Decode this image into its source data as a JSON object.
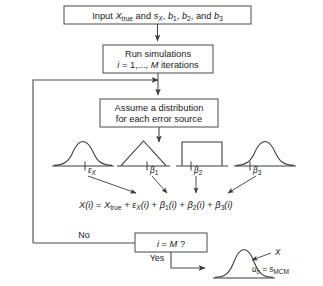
{
  "diagram": {
    "boxes": {
      "input": {
        "line1_pre": "Input ",
        "var_x": "X",
        "var_x_sub": "true",
        "mid1": " and ",
        "var_s": "s",
        "var_s_sub": "X",
        "mid2": ", ",
        "b1": "b",
        "b1_sub": "1",
        "mid3": ", ",
        "b2": "b",
        "b2_sub": "2",
        "mid4": ", and ",
        "b3": "b",
        "b3_sub": "3",
        "full_text": "Input Xtrue and sX, b1, b2, and b3"
      },
      "run": {
        "line1": "Run simulations",
        "line2_i": "i",
        "line2_rest": " = 1,..., ",
        "line2_m": "M",
        "line2_tail": " iterations",
        "full_text": "Run simulations i = 1,..., M iterations"
      },
      "assume": {
        "line1": "Assume a distribution",
        "line2": "for each error source",
        "full_text": "Assume a distribution for each error source"
      },
      "decision": {
        "i": "i",
        "eq": " = ",
        "m": "M",
        "q": " ?",
        "full_text": "i = M ?"
      }
    },
    "branches": {
      "no_label": "No",
      "yes_label": "Yes"
    },
    "distributions": [
      {
        "name": "normal-epsilon-x",
        "shape": "normal",
        "label_main": "ε",
        "label_sub": "X"
      },
      {
        "name": "triangular-beta1",
        "shape": "triangular",
        "label_main": "β",
        "label_sub": "1"
      },
      {
        "name": "rectangular-beta2",
        "shape": "rectangular",
        "label_main": "β",
        "label_sub": "2"
      },
      {
        "name": "normal-beta3",
        "shape": "normal",
        "label_main": "β",
        "label_sub": "3"
      }
    ],
    "equation": {
      "x_i": "X",
      "paren_i1": "(i)",
      "eq": " = ",
      "x_true": "X",
      "x_true_sub": "true",
      "plus1": " + ",
      "eps": "ε",
      "eps_sub": "X",
      "paren_i2": "(i)",
      "plus2": " + ",
      "beta1": "β",
      "beta1_sub": "1",
      "paren_i3": "(i)",
      "plus3": " + ",
      "beta2": "β",
      "beta2_sub": "2",
      "paren_i4": "(i)",
      "plus4": " + ",
      "beta3": "β",
      "beta3_sub": "3",
      "paren_i5": "(i)",
      "full_text": "X(i) = Xtrue + εX(i) + β1(i) + β2(i) + β3(i)"
    },
    "output": {
      "x_label": "X",
      "uc": "u",
      "uc_sub": "c",
      "uc_eq": " = ",
      "s": "s",
      "s_sub": "MCM",
      "full_text": "uc = sMCM"
    },
    "colors": {
      "stroke": "#4a4a4a",
      "text": "#1a1a1a",
      "background": "#ffffff"
    }
  }
}
